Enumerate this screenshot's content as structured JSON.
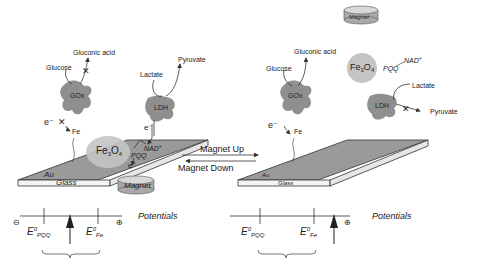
{
  "colors": {
    "background": "#ffffff",
    "surface_gold": "#9a9a9a",
    "glass": "#f4f4f4",
    "enzyme": "#8f8f8f",
    "fe3o4_particle": "#c4c4c4",
    "magnet_top": "#d8d8d8",
    "magnet_side": "#a9a9a9",
    "line": "#333333"
  },
  "left_panel": {
    "gox": {
      "label": "GOx",
      "substrate": "Glucose",
      "product": "Gluconic acid",
      "electron": "e⁻",
      "mediator": "Fe",
      "blocked_icon": "cross-icon"
    },
    "ldh": {
      "label": "LDH",
      "substrate": "Lactate",
      "product": "Pyruvate",
      "electron": "e⁻"
    },
    "particle": {
      "formula": "Fe",
      "sub3": "3",
      "o": "O",
      "sub4": "4"
    },
    "cofactors": {
      "nad": "NAD",
      "nad_sup": "+",
      "pqq": "PQQ",
      "electron": "e⁻"
    },
    "electrode": {
      "au": "Au",
      "glass": "Glass"
    },
    "magnet": "Magnet",
    "potentials": {
      "title": "Potentials",
      "minus": "⊖",
      "plus": "⊕",
      "e_pqq": {
        "e": "E",
        "sup": "0",
        "sub": "PQQ"
      },
      "e_fe": {
        "e": "E",
        "sup": "0",
        "sub": "Fe"
      }
    }
  },
  "center": {
    "magnet_up": "Magnet Up",
    "magnet_down": "Magnet Down"
  },
  "right_panel": {
    "magnet": "Magnet",
    "particle": {
      "formula": "Fe",
      "sub3": "3",
      "o": "O",
      "sub4": "4"
    },
    "cofactors": {
      "pqq": "PQQ",
      "nad": "NAD",
      "nad_sup": "+"
    },
    "gox": {
      "label": "GOx",
      "substrate": "Glucose",
      "product": "Gluconic acid",
      "electron": "e⁻",
      "mediator": "Fe"
    },
    "ldh": {
      "label": "LDH",
      "substrate": "Lactate",
      "product": "Pyruvate",
      "blocked_icon": "cross-icon"
    },
    "electrode": {
      "au": "Au",
      "glass": "Glass"
    },
    "potentials": {
      "title": "Potentials",
      "plus": "⊕",
      "e_pqq": {
        "e": "E",
        "sup": "0",
        "sub": "PQQ"
      },
      "e_fe": {
        "e": "E",
        "sup": "0",
        "sub": "Fe"
      }
    }
  }
}
